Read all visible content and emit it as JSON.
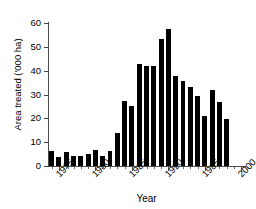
{
  "chart_data": {
    "type": "bar",
    "title": "",
    "xlabel": "Year",
    "ylabel": "Area treated ('000 ha)",
    "xlim": [
      1973.5,
      2000.5
    ],
    "ylim": [
      0,
      60
    ],
    "grid": false,
    "legend": null,
    "ytick_labels": [
      "0",
      "10",
      "20",
      "30",
      "40",
      "50",
      "60"
    ],
    "ytick_values": [
      0,
      10,
      20,
      30,
      40,
      50,
      60
    ],
    "xtick_labels": [
      "1975",
      "1980",
      "1985",
      "1990",
      "1995",
      "2000"
    ],
    "xtick_values": [
      1975,
      1980,
      1985,
      1990,
      1995,
      2000
    ],
    "categories": [
      "1974",
      "1975",
      "1976",
      "1977",
      "1978",
      "1979",
      "1980",
      "1981",
      "1982",
      "1983",
      "1984",
      "1985",
      "1986",
      "1987",
      "1988",
      "1989",
      "1990",
      "1991",
      "1992",
      "1993",
      "1994",
      "1995",
      "1996",
      "1997",
      "1998",
      "1999"
    ],
    "values": [
      6.2,
      3.6,
      5.7,
      4.3,
      4.2,
      5.0,
      6.6,
      4.4,
      6.2,
      14.0,
      27.2,
      25.0,
      42.6,
      41.8,
      41.8,
      53.3,
      57.4,
      37.8,
      35.5,
      33.2,
      29.5,
      20.8,
      31.8,
      26.7,
      19.6,
      0
    ],
    "bar_color": "#000000",
    "axis_color": "#4a4a4a"
  },
  "figure": {
    "y_axis_title": "Area treated ('000 ha)",
    "x_axis_title": "Year"
  }
}
